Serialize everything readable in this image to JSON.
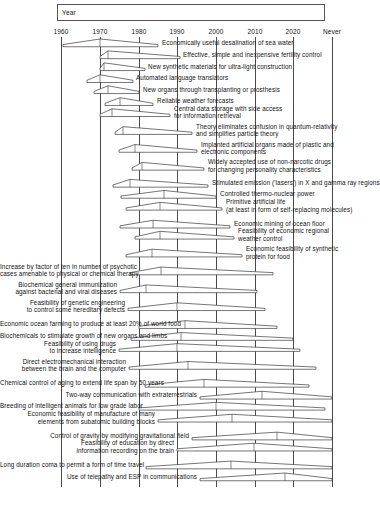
{
  "header": {
    "title": "Year"
  },
  "axis": {
    "tick_labels": [
      "1960",
      "1970",
      "1980",
      "1990",
      "2000",
      "2010",
      "2020",
      "Never"
    ],
    "tick_values": [
      1960,
      1970,
      1980,
      1990,
      2000,
      2010,
      2020,
      2030
    ],
    "tick_x": [
      61,
      100,
      139,
      177,
      216,
      255,
      293,
      332
    ],
    "never_label": "Never"
  },
  "chart_data": {
    "type": "bar",
    "title": "Year",
    "xlabel": "Year",
    "ylabel": "",
    "grid": true,
    "legend_position": "none",
    "categories": [
      "Economically useful desalination of sea water",
      "Effective, simple and inexpensive fertility control",
      "New synthetic materials for ultra-light construction",
      "Automated language translators",
      "New organs through transplanting or prosthesis",
      "Reliable weather forecasts",
      "Central data storage with side access for information retrieval",
      "Theory eliminates confusion in quantum-relativity and simplifies particle theory",
      "Implanted artificial organs made of plastic and electronic components",
      "Widely accepted use of non-narcotic drugs for changing personality characteristics",
      "Stimulated emission ('lasers') in X and gamma ray regions",
      "Controlled thermo-nuclear power",
      "Primitive artificial life (at least in form of self-replacing molecules)",
      "Economic mining of ocean floor",
      "Feasibility of economic regional weather control",
      "Economic feasibility of synthetic protein for food",
      "Increase by factor of ten in number of psychotic cases amenable to physical or chemical therapy",
      "Biochemical general immunization against bacterial and viral diseases",
      "Feasibility of genetic engineering to control some hereditary defects",
      "Economic ocean farming to produce at least 20% of world food",
      "Biochemicals to stimulate growth of new organs and limbs",
      "Feasibility of using drugs to increase intelligence",
      "Direct electromechanical interaction between the brain and the computer",
      "Chemical control of aging to extend life span by 50 years",
      "Two-way communication with extraterrestrials",
      "Breeding of intelligent animals for low grade labor",
      "Economic feasibility of manufacture of many elements from subatomic building blocks",
      "Control of gravity by modifying gravitational field",
      "Feasibility of education by direct information recording on the brain",
      "Long duration coma to permit a form of time travel",
      "Use of telepathy and ESP in communications"
    ],
    "series": [
      {
        "name": "Forecast quartile range (lower, median, upper)",
        "values": [
          [
            1966,
            1970,
            1985
          ],
          [
            1968,
            1972,
            1985
          ],
          [
            1968,
            1971,
            1978
          ],
          [
            1967,
            1970,
            1976
          ],
          [
            1968,
            1972,
            1982
          ],
          [
            1971,
            1975,
            1983
          ],
          [
            1969,
            1973,
            1989
          ],
          [
            1972,
            1975,
            1995
          ],
          [
            1973,
            1978,
            1996
          ],
          [
            1976,
            1980,
            1997
          ],
          [
            1973,
            1976,
            1998
          ],
          [
            1975,
            1985,
            2000
          ],
          [
            1976,
            1985,
            2002
          ],
          [
            1975,
            1983,
            2004
          ],
          [
            1979,
            1985,
            2005
          ],
          [
            1977,
            1983,
            2007
          ],
          [
            1978,
            1985,
            2014
          ],
          [
            1976,
            1982,
            2010
          ],
          [
            1978,
            1990,
            2012
          ],
          [
            1981,
            1992,
            2015
          ],
          [
            1979,
            1991,
            2020
          ],
          [
            1976,
            1990,
            2022
          ],
          [
            1978,
            1993,
            2026
          ],
          [
            1982,
            1997,
            2024
          ],
          [
            1996,
            2012,
            2030
          ],
          [
            1980,
            2000,
            2028
          ],
          [
            1985,
            2004,
            2030
          ],
          [
            1994,
            2016,
            2030
          ],
          [
            1990,
            2010,
            2030
          ],
          [
            1983,
            2005,
            2030
          ],
          [
            1994,
            2018,
            2030
          ]
        ]
      }
    ]
  },
  "rows": [
    {
      "label": "Economically useful desalination of sea water",
      "side": "right",
      "lines": 1,
      "y": 46,
      "x1": 63,
      "xm": 100,
      "x2": 158,
      "text_x": 162
    },
    {
      "label": "Effective, simple and inexpensive fertility control",
      "side": "right",
      "lines": 1,
      "y": 60,
      "x1": 100,
      "xm": 108,
      "x2": 180,
      "text_x": 183
    },
    {
      "label": "New synthetic materials for ultra-light construction",
      "side": "right",
      "lines": 1,
      "y": 74,
      "x1": 100,
      "xm": 104,
      "x2": 145,
      "text_x": 148
    },
    {
      "label": "Automated language translators",
      "side": "right",
      "lines": 1,
      "y": 88,
      "x1": 87,
      "xm": 100,
      "x2": 133,
      "text_x": 136
    },
    {
      "label": "New organs through transplanting or prosthesis",
      "side": "right",
      "lines": 1,
      "y": 101,
      "x1": 94,
      "xm": 108,
      "x2": 139,
      "text_x": 143
    },
    {
      "label": "Reliable weather forecasts",
      "side": "right",
      "lines": 1,
      "y": 115,
      "x1": 105,
      "xm": 120,
      "x2": 153,
      "text_x": 157
    },
    {
      "label": "Central data storage with side access\nfor information retrieval",
      "side": "right",
      "lines": 2,
      "y": 128,
      "x1": 100,
      "xm": 112,
      "x2": 170,
      "text_x": 174
    },
    {
      "label": "Theory eliminates confusion in quantum-relativity\nand simplifies particle theory",
      "side": "right",
      "lines": 2,
      "y": 149,
      "x1": 115,
      "xm": 123,
      "x2": 192,
      "text_x": 196
    },
    {
      "label": "Implanted artificial organs made of plastic and\nelectronic components",
      "side": "right",
      "lines": 2,
      "y": 170,
      "x1": 119,
      "xm": 135,
      "x2": 197,
      "text_x": 201
    },
    {
      "label": "Widely accepted use of non-narcotic drugs\nfor changing personality characteristics",
      "side": "right",
      "lines": 2,
      "y": 191,
      "x1": 132,
      "xm": 142,
      "x2": 204,
      "text_x": 208
    },
    {
      "label": "Stimulated emission ('lasers') in X and gamma ray regions",
      "side": "right",
      "lines": 1,
      "y": 211,
      "x1": 113,
      "xm": 130,
      "x2": 208,
      "text_x": 212
    },
    {
      "label": "Controlled thermo-nuclear power",
      "side": "right",
      "lines": 1,
      "y": 224,
      "x1": 121,
      "xm": 164,
      "x2": 216,
      "text_x": 220
    },
    {
      "label": "Primitive artificial life\n(at least in form of self-replacing molecules)",
      "side": "right",
      "lines": 2,
      "y": 238,
      "x1": 126,
      "xm": 160,
      "x2": 222,
      "text_x": 226
    },
    {
      "label": "Economic mining of ocean floor",
      "side": "right",
      "lines": 1,
      "y": 259,
      "x1": 120,
      "xm": 153,
      "x2": 230,
      "text_x": 234
    },
    {
      "label": "Feasibility of economic regional\nweather control",
      "side": "right",
      "lines": 2,
      "y": 272,
      "x1": 135,
      "xm": 160,
      "x2": 234,
      "text_x": 238
    },
    {
      "label": "Economic feasibility of synthetic\nprotein for food",
      "side": "right",
      "lines": 2,
      "y": 293,
      "x1": 126,
      "xm": 152,
      "x2": 242,
      "text_x": 246
    },
    {
      "label": "Increase by factor of ten in number of psychotic\ncases amenable to physical or chemical therapy",
      "side": "left",
      "lines": 2,
      "y": 314,
      "x1": 130,
      "xm": 161,
      "x2": 273,
      "text_x": 127
    },
    {
      "label": "Biochemical general immunization\nagainst bacterial and viral diseases",
      "side": "left",
      "lines": 2,
      "y": 335,
      "x1": 120,
      "xm": 146,
      "x2": 257,
      "text_x": 117
    },
    {
      "label": "Feasibility of genetic engineering\nto control some hereditary defects",
      "side": "left",
      "lines": 2,
      "y": 356,
      "x1": 128,
      "xm": 177,
      "x2": 265,
      "text_x": 125
    },
    {
      "label": "Economic ocean farming to produce at least 20% of world food",
      "side": "left",
      "lines": 1,
      "y": 377,
      "x1": 139,
      "xm": 185,
      "x2": 277,
      "text_x": 136
    },
    {
      "label": "Biochemicals to stimulate growth of new organs and limbs",
      "side": "left",
      "lines": 1,
      "y": 391,
      "x1": 131,
      "xm": 181,
      "x2": 293,
      "text_x": 128
    },
    {
      "label": "Feasibility of using drugs\nto increase intelligence",
      "side": "left",
      "lines": 2,
      "y": 404,
      "x1": 119,
      "xm": 177,
      "x2": 300,
      "text_x": 116
    },
    {
      "label": "Direct electromechanical interaction\nbetween the brain and the computer",
      "side": "left",
      "lines": 2,
      "y": 425,
      "x1": 129,
      "xm": 188,
      "x2": 316,
      "text_x": 126
    },
    {
      "label": "Chemical control of aging to extend life span by 50 years",
      "side": "left",
      "lines": 1,
      "y": 446,
      "x1": 145,
      "xm": 204,
      "x2": 309,
      "text_x": 142
    },
    {
      "label": "Two-way communication with extraterrestrials",
      "side": "left",
      "lines": 1,
      "y": 460,
      "x1": 200,
      "xm": 262,
      "x2": 332,
      "text_x": 197
    },
    {
      "label": "Breeding of intelligent animals for low grade labor",
      "side": "left",
      "lines": 1,
      "y": 473,
      "x1": 139,
      "xm": 216,
      "x2": 325,
      "text_x": 136
    },
    {
      "label": "Economic feasibility of manufacture of many\nelements from subatomic building blocks",
      "side": "left",
      "lines": 2,
      "y": 487,
      "x1": 158,
      "xm": 232,
      "x2": 332,
      "text_x": 155
    },
    {
      "label": "Control of gravity by modifying gravitational field",
      "side": "left",
      "lines": 1,
      "y": 508,
      "x1": 192,
      "xm": 277,
      "x2": 332,
      "text_x": 189
    },
    {
      "label": "Feasibility of education by direct\ninformation recording on the brain",
      "side": "left",
      "lines": 2,
      "y": 521,
      "x1": 177,
      "xm": 254,
      "x2": 332,
      "text_x": 174
    },
    {
      "label": "Long duration coma to permit a form of time travel",
      "side": "left",
      "lines": 1,
      "y": 542,
      "x1": 146,
      "xm": 231,
      "x2": 332,
      "text_x": 143
    },
    {
      "label": "Use of telepathy and ESP in communications",
      "side": "left",
      "lines": 1,
      "y": 556,
      "x1": 200,
      "xm": 285,
      "x2": 332,
      "text_x": 197
    }
  ],
  "style": {
    "line_color": "#3b3b3b",
    "grid_color": "#4a4a4a",
    "text_color": "#111111",
    "background": "#ffffff"
  }
}
